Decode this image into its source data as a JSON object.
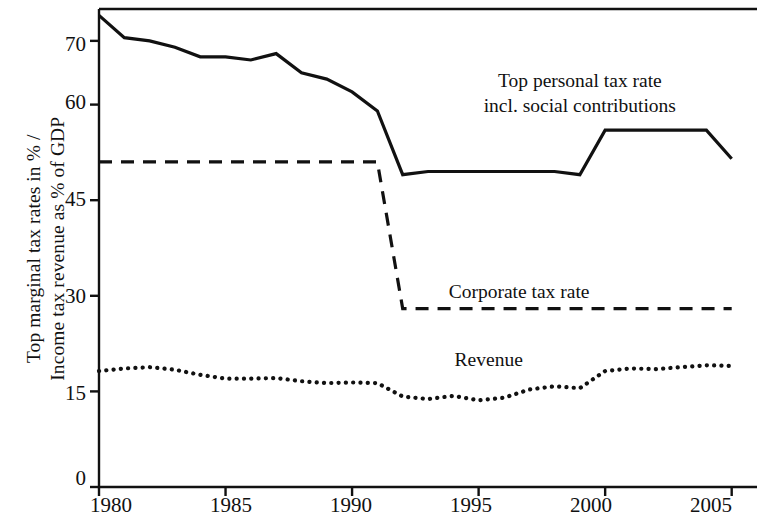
{
  "chart_data": {
    "type": "line",
    "title": "",
    "subtitle": "",
    "xlabel": "",
    "ylabel": "Top marginal tax rates in % / Income tax revenue as % of GDP",
    "ylabel_line1": "Top marginal tax rates in % /",
    "ylabel_line2": "Income tax revenue as % of GDP",
    "xlim": [
      1980,
      2006
    ],
    "ylim": [
      0,
      75
    ],
    "xticks": [
      1980,
      1985,
      1990,
      1995,
      2000,
      2005
    ],
    "xtick_labels": [
      "1980",
      "1985",
      "1990",
      "1995",
      "2000",
      "2005"
    ],
    "yticks": [
      0,
      15,
      30,
      45,
      60,
      70
    ],
    "ytick_labels": [
      "0",
      "15",
      "30",
      "45",
      "60",
      "70"
    ],
    "grid": false,
    "legend_position": "inline-annotations",
    "x": [
      1980,
      1981,
      1982,
      1983,
      1984,
      1985,
      1986,
      1987,
      1988,
      1989,
      1990,
      1991,
      1992,
      1993,
      1994,
      1995,
      1996,
      1997,
      1998,
      1999,
      2000,
      2001,
      2002,
      2003,
      2004,
      2005
    ],
    "series": [
      {
        "name": "Top personal tax rate incl. social contributions",
        "style": "solid",
        "color": "#111111",
        "values": [
          74.0,
          70.5,
          70.0,
          69.0,
          67.5,
          67.5,
          67.0,
          68.0,
          65.0,
          64.0,
          62.0,
          59.0,
          49.0,
          49.5,
          49.5,
          49.5,
          49.5,
          49.5,
          49.5,
          49.0,
          56.0,
          56.0,
          56.0,
          56.0,
          56.0,
          51.5
        ]
      },
      {
        "name": "Corporate tax rate",
        "style": "dashed",
        "color": "#111111",
        "values": [
          51.0,
          51.0,
          51.0,
          51.0,
          51.0,
          51.0,
          51.0,
          51.0,
          51.0,
          51.0,
          51.0,
          51.0,
          28.0,
          28.0,
          28.0,
          28.0,
          28.0,
          28.0,
          28.0,
          28.0,
          28.0,
          28.0,
          28.0,
          28.0,
          28.0,
          28.0
        ]
      },
      {
        "name": "Revenue",
        "style": "dotted",
        "color": "#111111",
        "values": [
          18.2,
          18.6,
          18.8,
          18.4,
          17.6,
          17.0,
          17.0,
          17.1,
          16.6,
          16.3,
          16.4,
          16.3,
          14.2,
          13.8,
          14.3,
          13.6,
          14.0,
          15.3,
          15.8,
          15.5,
          18.2,
          18.6,
          18.5,
          18.8,
          19.1,
          19.0
        ]
      }
    ],
    "annotations": [
      {
        "id": "ann-personal",
        "line1": "Top personal tax rate",
        "line2": "incl. social contributions",
        "x": 1999.0,
        "y": 63.5
      },
      {
        "id": "ann-corporate",
        "line1": "Corporate tax rate",
        "line2": "",
        "x": 1996.6,
        "y": 30.5
      },
      {
        "id": "ann-revenue",
        "line1": "Revenue",
        "line2": "",
        "x": 1995.4,
        "y": 19.8
      }
    ]
  },
  "axes": {
    "ytick_0": "0",
    "ytick_15": "15",
    "ytick_30": "30",
    "ytick_45": "45",
    "ytick_60": "60",
    "ytick_70": "70",
    "xtick_1980": "1980",
    "xtick_1985": "1985",
    "xtick_1990": "1990",
    "xtick_1995": "1995",
    "xtick_2000": "2000",
    "xtick_2005": "2005"
  },
  "axis_label": {
    "line1": "Top marginal tax rates in % /",
    "line2": "Income tax revenue as % of GDP"
  },
  "annotations": {
    "personal_line1": "Top personal tax rate",
    "personal_line2": "incl. social contributions",
    "corporate": "Corporate tax rate",
    "revenue": "Revenue"
  },
  "colors": {
    "ink": "#111111",
    "background": "#ffffff"
  }
}
